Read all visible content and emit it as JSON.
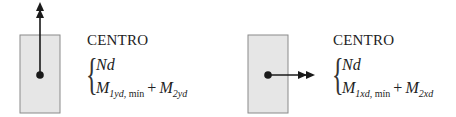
{
  "diagrams": [
    {
      "id": "y-direction",
      "arrow_direction": "up",
      "title": "CENTRO",
      "line1": "Nd",
      "line2": {
        "term1_symbol": "M",
        "term1_sub_italic": "1yd",
        "term1_sub_roman": ", mín",
        "operator": "+",
        "term2_symbol": "M",
        "term2_sub_italic": "2yd"
      }
    },
    {
      "id": "x-direction",
      "arrow_direction": "right",
      "title": "CENTRO",
      "line1": "Nd",
      "line2": {
        "term1_symbol": "M",
        "term1_sub_italic": "1xd",
        "term1_sub_roman": ", mín",
        "operator": "+",
        "term2_symbol": "M",
        "term2_sub_italic": "2xd"
      }
    }
  ],
  "colors": {
    "section_fill": "#e6e6e6",
    "section_stroke": "#8a8a8a",
    "arrow": "#1a1a1a"
  }
}
